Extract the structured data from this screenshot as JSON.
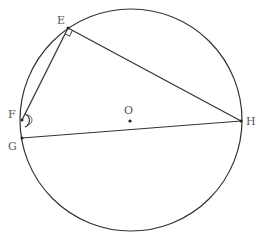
{
  "diagram": {
    "type": "circle-geometry",
    "circle": {
      "center": "O",
      "cx": 131,
      "cy": 120,
      "r": 111
    },
    "points": [
      {
        "name": "E",
        "x": 68,
        "y": 28,
        "label_x": 57,
        "label_y": 24
      },
      {
        "name": "F",
        "x": 22,
        "y": 120,
        "label_x": 8,
        "label_y": 118
      },
      {
        "name": "G",
        "x": 22,
        "y": 138,
        "label_x": 8,
        "label_y": 150
      },
      {
        "name": "H",
        "x": 241,
        "y": 121,
        "label_x": 246,
        "label_y": 125
      },
      {
        "name": "O",
        "x": 130,
        "y": 121,
        "label_x": 124,
        "label_y": 114
      }
    ],
    "segments": [
      "EF",
      "EH",
      "GH"
    ],
    "annotations": {
      "right_angle_at": "E",
      "angle_arc_at": "F"
    },
    "colors": {
      "stroke": "#333333",
      "label": "#555555"
    }
  }
}
